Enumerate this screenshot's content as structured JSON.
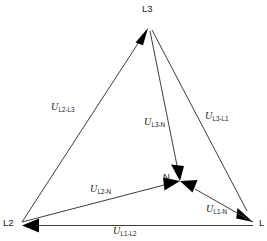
{
  "diagram": {
    "background_color": "#ffffff",
    "line_color": "#3d3d3d",
    "arrow_color": "#000000",
    "text_color": "#1a1a1a",
    "nodes": [
      {
        "id": "L3",
        "label": "L3",
        "x": 148,
        "y": 28,
        "label_x": 142,
        "label_y": 12
      },
      {
        "id": "L2",
        "label": "L2",
        "x": 22,
        "y": 222,
        "label_x": 3,
        "label_y": 226
      },
      {
        "id": "L1",
        "label": "L",
        "x": 253,
        "y": 222,
        "label_x": 259,
        "label_y": 226
      },
      {
        "id": "N",
        "label": "N",
        "x": 180,
        "y": 181,
        "label_x": 163,
        "label_y": 180
      }
    ],
    "edges": [
      {
        "id": "u-l2-l3",
        "from": "L2",
        "to": "L3",
        "label_u": "U",
        "label_sub": "L2-L3",
        "label_x": 51,
        "label_y": 110
      },
      {
        "id": "u-l3-l1",
        "from": "L3",
        "to": "L1",
        "label_u": "U",
        "label_sub": "L3-L1",
        "label_x": 205,
        "label_y": 119
      },
      {
        "id": "u-l1-l2",
        "from": "L1",
        "to": "L2",
        "label_u": "U",
        "label_sub": "L1-L2",
        "label_x": 113,
        "label_y": 234
      },
      {
        "id": "u-l3-n",
        "from": "L3",
        "to": "N",
        "label_u": "U",
        "label_sub": "L3-N",
        "label_x": 144,
        "label_y": 125
      },
      {
        "id": "u-l2-n",
        "from": "L2",
        "to": "N",
        "label_u": "U",
        "label_sub": "L2-N",
        "label_x": 90,
        "label_y": 192
      },
      {
        "id": "u-l1-n",
        "from": "L1",
        "to": "N",
        "label_u": "U",
        "label_sub": "L1-N",
        "label_x": 206,
        "label_y": 212
      }
    ]
  }
}
